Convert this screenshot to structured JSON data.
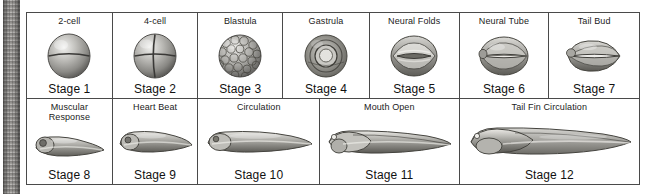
{
  "figure": {
    "binding_strip": "book-spine-texture",
    "rows": [
      {
        "name": "early-stages-row",
        "cells": [
          {
            "descriptor": "2-cell",
            "stage": "Stage 1",
            "art": "two-cell-embryo",
            "width": 86
          },
          {
            "descriptor": "4-cell",
            "stage": "Stage 2",
            "art": "four-cell-embryo",
            "width": 86
          },
          {
            "descriptor": "Blastula",
            "stage": "Stage 3",
            "art": "blastula-embryo",
            "width": 85
          },
          {
            "descriptor": "Gastrula",
            "stage": "Stage 4",
            "art": "gastrula-embryo",
            "width": 87
          },
          {
            "descriptor": "Neural Folds",
            "stage": "Stage 5",
            "art": "neural-folds-embryo",
            "width": 90
          },
          {
            "descriptor": "Neural Tube",
            "stage": "Stage 6",
            "art": "neural-tube-embryo",
            "width": 90
          },
          {
            "descriptor": "Tail Bud",
            "stage": "Stage 7",
            "art": "tail-bud-embryo",
            "width": 90
          }
        ]
      },
      {
        "name": "tadpole-stages-row",
        "cells": [
          {
            "descriptor": "Muscular\nResponse",
            "stage": "Stage 8",
            "art": "tadpole-early",
            "width": 86
          },
          {
            "descriptor": "Heart Beat",
            "stage": "Stage 9",
            "art": "tadpole-heartbeat",
            "width": 86
          },
          {
            "descriptor": "Circulation",
            "stage": "Stage 10",
            "art": "tadpole-circulation",
            "width": 122
          },
          {
            "descriptor": "Mouth Open",
            "stage": "Stage 11",
            "art": "tadpole-mouth-open",
            "width": 140
          },
          {
            "descriptor": "Tail Fin Circulation",
            "stage": "Stage 12",
            "art": "tadpole-tail-fin",
            "width": 180
          }
        ]
      }
    ]
  },
  "colors": {
    "border": "#4a4a4a",
    "text": "#1b1b1b",
    "page_background": "#ffffff",
    "art_light": "#e8e8e6",
    "art_mid": "#a9a8a4",
    "art_dark": "#5c5b58"
  }
}
